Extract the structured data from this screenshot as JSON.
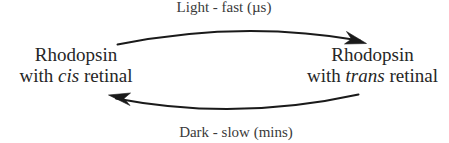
{
  "diagram": {
    "background_color": "#ffffff",
    "stroke_color": "#1a1a1a",
    "text_color": "#262626",
    "nodes": [
      {
        "id": "cis",
        "line1": "Rhodopsin",
        "line2_prefix": "with ",
        "line2_emphasis": "cis",
        "line2_suffix": " retinal"
      },
      {
        "id": "trans",
        "line1": "Rhodopsin",
        "line2_prefix": "with ",
        "line2_emphasis": "trans",
        "line2_suffix": " retinal"
      }
    ],
    "edges": [
      {
        "id": "forward",
        "label": "Light - fast (µs)",
        "direction": "cis-to-trans",
        "position": "top"
      },
      {
        "id": "reverse",
        "label": "Dark - slow (mins)",
        "direction": "trans-to-cis",
        "position": "bottom"
      }
    ]
  }
}
